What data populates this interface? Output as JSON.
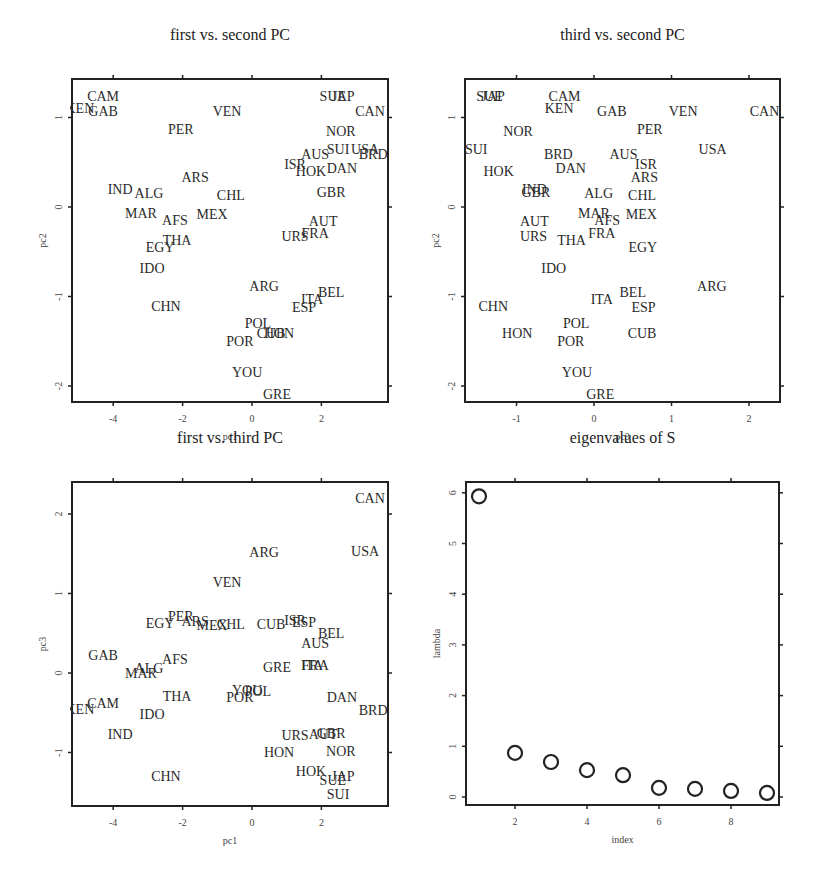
{
  "figure": {
    "layout": "2x2 grid of base-R style plots",
    "panels": [
      {
        "id": "p1",
        "title": "first  vs. second PC",
        "xlabel": "pc1",
        "ylabel": "pc2",
        "xvar": "pc1",
        "yvar": "pc2",
        "frame": {
          "left": 72,
          "top": 79,
          "right": 388,
          "bottom": 402
        },
        "xscale": {
          "origin_px": 252,
          "px_per_unit": 34.7
        },
        "yscale": {
          "origin_px": 207,
          "px_per_unit": 89.5
        },
        "xticks": [
          -4,
          -2,
          0,
          2
        ],
        "yticks": [
          -2,
          -1,
          0,
          1
        ],
        "title_y": 40
      },
      {
        "id": "p2",
        "title": "third vs. second PC",
        "xlabel": "pc3",
        "ylabel": "pc2",
        "xvar": "pc3",
        "yvar": "pc2",
        "frame": {
          "left": 465,
          "top": 79,
          "right": 780,
          "bottom": 402
        },
        "xscale": {
          "origin_px": 594,
          "px_per_unit": 77.5
        },
        "yscale": {
          "origin_px": 207,
          "px_per_unit": 89.5
        },
        "xticks": [
          -1,
          0,
          1,
          2
        ],
        "yticks": [
          -2,
          -1,
          0,
          1
        ],
        "title_y": 40
      },
      {
        "id": "p3",
        "title": "first  vs. third PC",
        "xlabel": "pc1",
        "ylabel": "pc3",
        "xvar": "pc1",
        "yvar": "pc3",
        "frame": {
          "left": 72,
          "top": 482,
          "right": 388,
          "bottom": 806
        },
        "xscale": {
          "origin_px": 252,
          "px_per_unit": 34.7
        },
        "yscale": {
          "origin_px": 673,
          "px_per_unit": 79.5
        },
        "xticks": [
          -4,
          -2,
          0,
          2
        ],
        "yticks": [
          -1,
          0,
          1,
          2
        ],
        "title_y": 443
      },
      {
        "id": "p4",
        "title": "eigenvalues of S",
        "xlabel": "index",
        "ylabel": "lambda",
        "frame": {
          "left": 466,
          "top": 482,
          "right": 779,
          "bottom": 805
        },
        "xscale": {
          "origin_px": 443,
          "px_per_unit": 36
        },
        "yscale": {
          "origin_px": 797,
          "px_per_unit": 50.7
        },
        "xticks": [
          2,
          4,
          6,
          8
        ],
        "yticks": [
          0,
          1,
          2,
          3,
          4,
          5,
          6
        ],
        "title_y": 443
      }
    ]
  },
  "chart_data": [
    {
      "type": "scatter",
      "title": "first  vs. second PC",
      "xlabel": "pc1",
      "ylabel": "pc2",
      "xlim": [
        -5.2,
        3.9
      ],
      "ylim": [
        -2.2,
        1.4
      ],
      "xticks": [
        -4,
        -2,
        0,
        2
      ],
      "yticks": [
        -2,
        -1,
        0,
        1
      ],
      "grid": false,
      "markers": "text labels (country codes)",
      "points_ref": "countries (x = pc1, y = pc2)"
    },
    {
      "type": "scatter",
      "title": "third vs. second PC",
      "xlabel": "pc3",
      "ylabel": "pc2",
      "xlim": [
        -1.65,
        2.4
      ],
      "ylim": [
        -2.2,
        1.4
      ],
      "xticks": [
        -1,
        0,
        1,
        2
      ],
      "yticks": [
        -2,
        -1,
        0,
        1
      ],
      "grid": false,
      "markers": "text labels (country codes)",
      "points_ref": "countries (x = pc3, y = pc2)"
    },
    {
      "type": "scatter",
      "title": "first  vs. third PC",
      "xlabel": "pc1",
      "ylabel": "pc3",
      "xlim": [
        -5.2,
        3.9
      ],
      "ylim": [
        -1.7,
        2.4
      ],
      "xticks": [
        -4,
        -2,
        0,
        2
      ],
      "yticks": [
        -1,
        0,
        1,
        2
      ],
      "grid": false,
      "markers": "text labels (country codes)",
      "points_ref": "countries (x = pc1, y = pc3)"
    },
    {
      "type": "scatter",
      "title": "eigenvalues of S",
      "xlabel": "index",
      "ylabel": "lambda",
      "xlim": [
        0.65,
        9.4
      ],
      "ylim": [
        -0.15,
        6.2
      ],
      "xticks": [
        2,
        4,
        6,
        8
      ],
      "yticks": [
        0,
        1,
        2,
        3,
        4,
        5,
        6
      ],
      "grid": false,
      "markers": "open circles",
      "x": [
        1,
        2,
        3,
        4,
        5,
        6,
        7,
        8,
        9
      ],
      "values": [
        5.93,
        0.87,
        0.69,
        0.53,
        0.43,
        0.18,
        0.16,
        0.12,
        0.08
      ]
    }
  ],
  "countries": [
    {
      "code": "CAM",
      "pc1": -4.29,
      "pc2": 1.24,
      "pc3": -0.38
    },
    {
      "code": "KEN",
      "pc1": -4.96,
      "pc2": 1.11,
      "pc3": -0.45
    },
    {
      "code": "GAB",
      "pc1": -4.29,
      "pc2": 1.07,
      "pc3": 0.23
    },
    {
      "code": "VEN",
      "pc1": -0.72,
      "pc2": 1.07,
      "pc3": 1.15
    },
    {
      "code": "PER",
      "pc1": -2.05,
      "pc2": 0.87,
      "pc3": 0.72
    },
    {
      "code": "SUE",
      "pc1": 2.33,
      "pc2": 1.24,
      "pc3": -1.35
    },
    {
      "code": "JAP",
      "pc1": 2.62,
      "pc2": 1.24,
      "pc3": -1.3
    },
    {
      "code": "CAN",
      "pc1": 3.4,
      "pc2": 1.07,
      "pc3": 2.2
    },
    {
      "code": "NOR",
      "pc1": 2.56,
      "pc2": 0.85,
      "pc3": -0.98
    },
    {
      "code": "SUI",
      "pc1": 2.48,
      "pc2": 0.65,
      "pc3": -1.52
    },
    {
      "code": "USA",
      "pc1": 3.26,
      "pc2": 0.65,
      "pc3": 1.53
    },
    {
      "code": "BRD",
      "pc1": 3.49,
      "pc2": 0.59,
      "pc3": -0.46
    },
    {
      "code": "AUS",
      "pc1": 1.82,
      "pc2": 0.59,
      "pc3": 0.38
    },
    {
      "code": "ISR",
      "pc1": 1.24,
      "pc2": 0.48,
      "pc3": 0.67
    },
    {
      "code": "HOK",
      "pc1": 1.7,
      "pc2": 0.4,
      "pc3": -1.23
    },
    {
      "code": "DAN",
      "pc1": 2.59,
      "pc2": 0.44,
      "pc3": -0.3
    },
    {
      "code": "ARS",
      "pc1": -1.64,
      "pc2": 0.34,
      "pc3": 0.65
    },
    {
      "code": "IND",
      "pc1": -3.8,
      "pc2": 0.2,
      "pc3": -0.77
    },
    {
      "code": "ALG",
      "pc1": -2.97,
      "pc2": 0.16,
      "pc3": 0.06
    },
    {
      "code": "CHL",
      "pc1": -0.61,
      "pc2": 0.13,
      "pc3": 0.62
    },
    {
      "code": "GBR",
      "pc1": 2.28,
      "pc2": 0.17,
      "pc3": -0.75
    },
    {
      "code": "MAR",
      "pc1": -3.2,
      "pc2": -0.07,
      "pc3": 0.0
    },
    {
      "code": "AFS",
      "pc1": -2.22,
      "pc2": -0.15,
      "pc3": 0.17
    },
    {
      "code": "MEX",
      "pc1": -1.15,
      "pc2": -0.08,
      "pc3": 0.61
    },
    {
      "code": "AUT",
      "pc1": 2.05,
      "pc2": -0.16,
      "pc3": -0.77
    },
    {
      "code": "URS",
      "pc1": 1.24,
      "pc2": -0.32,
      "pc3": -0.78
    },
    {
      "code": "FRA",
      "pc1": 1.82,
      "pc2": -0.29,
      "pc3": 0.1
    },
    {
      "code": "EGY",
      "pc1": -2.65,
      "pc2": -0.45,
      "pc3": 0.63
    },
    {
      "code": "THA",
      "pc1": -2.16,
      "pc2": -0.37,
      "pc3": -0.29
    },
    {
      "code": "IDO",
      "pc1": -2.88,
      "pc2": -0.68,
      "pc3": -0.52
    },
    {
      "code": "ARG",
      "pc1": 0.35,
      "pc2": -0.88,
      "pc3": 1.52
    },
    {
      "code": "BEL",
      "pc1": 2.28,
      "pc2": -0.95,
      "pc3": 0.5
    },
    {
      "code": "ITA",
      "pc1": 1.73,
      "pc2": -1.03,
      "pc3": 0.1
    },
    {
      "code": "ESP",
      "pc1": 1.5,
      "pc2": -1.12,
      "pc3": 0.64
    },
    {
      "code": "CHN",
      "pc1": -2.48,
      "pc2": -1.11,
      "pc3": -1.3
    },
    {
      "code": "POL",
      "pc1": 0.17,
      "pc2": -1.3,
      "pc3": -0.23
    },
    {
      "code": "CUB",
      "pc1": 0.55,
      "pc2": -1.41,
      "pc3": 0.62
    },
    {
      "code": "HON",
      "pc1": 0.78,
      "pc2": -1.41,
      "pc3": -0.99
    },
    {
      "code": "POR",
      "pc1": -0.35,
      "pc2": -1.5,
      "pc3": -0.3
    },
    {
      "code": "YOU",
      "pc1": -0.14,
      "pc2": -1.84,
      "pc3": -0.22
    },
    {
      "code": "GRE",
      "pc1": 0.72,
      "pc2": -2.09,
      "pc3": 0.08
    }
  ]
}
